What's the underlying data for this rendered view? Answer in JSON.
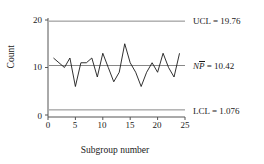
{
  "chart_data": {
    "type": "line",
    "title": "",
    "xlabel": "Subgroup number",
    "ylabel": "Count",
    "xlim": [
      0,
      25
    ],
    "ylim": [
      0,
      20
    ],
    "xticks": [
      0,
      5,
      10,
      15,
      20,
      25
    ],
    "yticks": [
      0,
      10,
      20
    ],
    "grid": false,
    "legend": "none",
    "x": [
      1,
      2,
      3,
      4,
      5,
      6,
      7,
      8,
      9,
      10,
      11,
      12,
      13,
      14,
      15,
      16,
      17,
      18,
      19,
      20,
      21,
      22,
      23,
      24
    ],
    "values": [
      12,
      11,
      10,
      12,
      6,
      11,
      11,
      12,
      8,
      13,
      10,
      7,
      9,
      15,
      11,
      9,
      6,
      9,
      11,
      9,
      13,
      10,
      8,
      13
    ],
    "series": [
      {
        "name": "Count",
        "values": [
          12,
          11,
          10,
          12,
          6,
          11,
          11,
          12,
          8,
          13,
          10,
          7,
          9,
          15,
          11,
          9,
          6,
          9,
          11,
          9,
          13,
          10,
          8,
          13
        ]
      }
    ],
    "control_limits": {
      "ucl": 19.76,
      "center": 10.42,
      "lcl": 1.076
    },
    "annotations": [
      {
        "name": "ucl",
        "prefix": "UCL",
        "separator": " = ",
        "value": "19.76",
        "y": 19.76
      },
      {
        "name": "center",
        "prefix_italic": "N",
        "prefix_overbar": "P",
        "separator": " = ",
        "value": "10.42",
        "y": 10.42
      },
      {
        "name": "lcl",
        "prefix": "LCL",
        "separator": " = ",
        "value": "1.076",
        "y": 1.076
      }
    ],
    "colors": {
      "data_line": "#1a1a1a",
      "limit_line": "#777777",
      "axis": "#555555",
      "background": "#ffffff"
    }
  },
  "axes": {
    "y_tick_labels": [
      "0",
      "10",
      "20"
    ],
    "x_tick_labels": [
      "0",
      "5",
      "10",
      "15",
      "20",
      "25"
    ],
    "y_title": "Count",
    "x_title": "Subgroup number"
  },
  "annotations_text": {
    "ucl_label": "UCL",
    "ucl_eq": " = ",
    "ucl_value": "19.76",
    "center_n": "N",
    "center_p": "P",
    "center_eq": " = ",
    "center_value": "10.42",
    "lcl_label": "LCL",
    "lcl_eq": " = ",
    "lcl_value": "1.076"
  }
}
